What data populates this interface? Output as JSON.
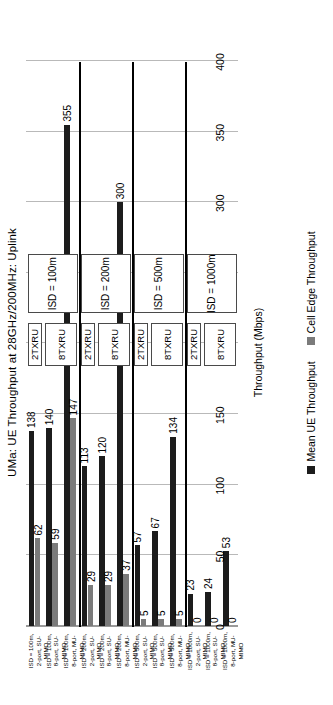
{
  "chart_data": {
    "type": "bar",
    "title": "UMa: UE Throughput at 28GHz/200MHz: Uplink",
    "xlabel": "",
    "ylabel": "Throughput (Mbps)",
    "ylim": [
      0,
      400
    ],
    "yticks": [
      "0",
      "50",
      "100",
      "150",
      "200",
      "250",
      "300",
      "350",
      "400"
    ],
    "grid": true,
    "orientation": "horizontal",
    "legend_position": "bottom",
    "categories": [
      "ISD = 100m,\n2-port, SU-\nMIMO",
      "ISD = 100m,\n8-port, SU-\nMIMO",
      "ISD = 100m,\n8-port, MU-\nMIMO",
      "ISD = 200m,\n2-port, SU-\nMIMO",
      "ISD = 200m,\n8-port, SU-\nMIMO",
      "ISD = 200m,\n8-port, MU-\nMIMO",
      "ISD = 500m,\n2-port, SU-\nMIMO",
      "ISD = 500m,\n8-port, SU-\nMIMO",
      "ISD = 500m,\n8-port, MU-\nMIMO",
      "ISD = 1000m,\n2-port, SU-\nMIMO",
      "ISD = 1000m,\n8-port, SU-\nMIMO",
      "ISD = 1000m,\n8-port, MU-\nMIMO"
    ],
    "series": [
      {
        "name": "Mean UE Throughput",
        "color": "#1c1c1c",
        "values": [
          138,
          140,
          355,
          113,
          120,
          300,
          57,
          67,
          134,
          23,
          24,
          53
        ]
      },
      {
        "name": "Cell Edge Throughput",
        "color": "#7b7b7b",
        "values": [
          62,
          59,
          147,
          29,
          29,
          37,
          5,
          5,
          5,
          0,
          0,
          0
        ]
      }
    ],
    "annotations": {
      "isd_groups": [
        "ISD = 100m",
        "ISD = 200m",
        "ISD = 500m",
        "ISD = 1000m"
      ],
      "txru_groups": [
        "2TXRU",
        "8TXRU",
        "2TXRU",
        "8TXRU",
        "2TXRU",
        "8TXRU",
        "2TXRU",
        "8TXRU"
      ]
    }
  },
  "legend": {
    "items": [
      {
        "label": "Mean UE Throughput",
        "color": "#1c1c1c"
      },
      {
        "label": "Cell Edge Throughput",
        "color": "#7b7b7b"
      }
    ]
  }
}
